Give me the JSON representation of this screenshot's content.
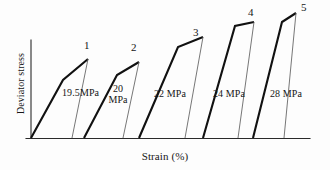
{
  "figure": {
    "axes": {
      "x_label": "Strain (%)",
      "y_label": "Deviator stress"
    },
    "curve_numbers": [
      "1",
      "2",
      "3",
      "4",
      "5"
    ],
    "stress_labels": [
      "19.5MPa",
      "20 MPa",
      "22 MPa",
      "24 MPa",
      "28 MPa"
    ],
    "stress_labels_split": [
      {
        "line1": "19.5MPa",
        "line2": ""
      },
      {
        "line1": "20",
        "line2": "MPa"
      },
      {
        "line1": "22 MPa",
        "line2": ""
      },
      {
        "line1": "24 MPa",
        "line2": ""
      },
      {
        "line1": "28  MPa",
        "line2": ""
      }
    ],
    "colors": {
      "axis": "#2a2a2a",
      "loading_curve": "#111111",
      "unloading_curve": "#5f5f5f",
      "background": "#fdfdfd"
    }
  },
  "chart_data": {
    "type": "line",
    "title": "",
    "xlabel": "Strain (%)",
    "ylabel": "Deviator stress",
    "grid": false,
    "legend": "none",
    "axis_ticks": {
      "x": [],
      "y": []
    },
    "series": [
      {
        "name": "1",
        "confining_stress": "19.5MPa",
        "loading_path": [
          [
            31,
            138
          ],
          [
            63,
            80
          ],
          [
            88,
            59
          ]
        ],
        "unloading_path": [
          [
            88,
            59
          ],
          [
            72,
            138
          ]
        ],
        "peak_label_pos": [
          84,
          42
        ]
      },
      {
        "name": "2",
        "confining_stress": "20 MPa",
        "loading_path": [
          [
            84,
            138
          ],
          [
            117,
            75
          ],
          [
            139,
            62
          ]
        ],
        "unloading_path": [
          [
            139,
            62
          ],
          [
            123,
            138
          ]
        ],
        "peak_label_pos": [
          127,
          44
        ]
      },
      {
        "name": "3",
        "confining_stress": "22 MPa",
        "loading_path": [
          [
            139,
            138
          ],
          [
            178,
            47
          ],
          [
            203,
            37
          ]
        ],
        "unloading_path": [
          [
            203,
            37
          ],
          [
            185,
            138
          ]
        ],
        "peak_label_pos": [
          182,
          29
        ]
      },
      {
        "name": "4",
        "confining_stress": "24 MPa",
        "loading_path": [
          [
            203,
            138
          ],
          [
            235,
            26
          ],
          [
            254,
            22
          ]
        ],
        "unloading_path": [
          [
            254,
            22
          ],
          [
            238,
            138
          ]
        ],
        "peak_label_pos": [
          235,
          10
        ]
      },
      {
        "name": "5",
        "confining_stress": "28 MPa",
        "loading_path": [
          [
            253,
            138
          ],
          [
            282,
            22
          ],
          [
            296,
            13
          ]
        ],
        "unloading_path": [
          [
            296,
            13
          ],
          [
            284,
            138
          ]
        ],
        "peak_label_pos": [
          290,
          3
        ]
      }
    ]
  }
}
